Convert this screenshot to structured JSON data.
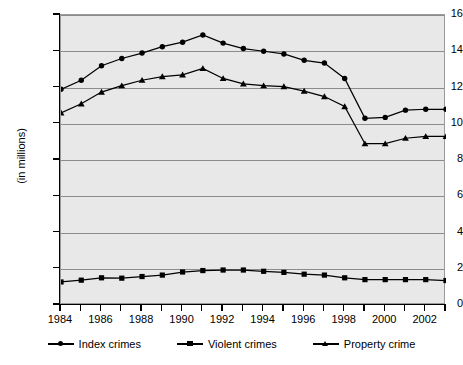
{
  "chart_data": {
    "type": "line",
    "title": "",
    "xlabel": "",
    "ylabel": "(in millions)",
    "xlim": [
      1984,
      2003
    ],
    "ylim": [
      0,
      16
    ],
    "grid": true,
    "legend_position": "bottom",
    "x": [
      1984,
      1985,
      1986,
      1987,
      1988,
      1989,
      1990,
      1991,
      1992,
      1993,
      1994,
      1995,
      1996,
      1997,
      1998,
      1999,
      2000,
      2001,
      2002,
      2003
    ],
    "x_tick_labels": [
      "1984",
      "",
      "1986",
      "",
      "1988",
      "",
      "1990",
      "",
      "1992",
      "",
      "1994",
      "",
      "1996",
      "",
      "1998",
      "",
      "2000",
      "",
      "2002",
      ""
    ],
    "y_tick_labels": [
      "0",
      "2",
      "4",
      "6",
      "8",
      "10",
      "12",
      "14",
      "16"
    ],
    "y_ticks": [
      0,
      2,
      4,
      6,
      8,
      10,
      12,
      14,
      16
    ],
    "series": [
      {
        "name": "Index crimes",
        "marker": "circle",
        "values": [
          11.9,
          12.4,
          13.2,
          13.6,
          13.9,
          14.25,
          14.5,
          14.9,
          14.45,
          14.15,
          14.0,
          13.85,
          13.5,
          13.35,
          12.5,
          10.3,
          10.35,
          10.75,
          10.8,
          10.8
        ]
      },
      {
        "name": "Violent crimes",
        "marker": "square",
        "values": [
          1.27,
          1.37,
          1.5,
          1.48,
          1.57,
          1.65,
          1.82,
          1.9,
          1.93,
          1.93,
          1.86,
          1.8,
          1.7,
          1.65,
          1.5,
          1.4,
          1.4,
          1.4,
          1.4,
          1.35
        ]
      },
      {
        "name": "Property crime",
        "marker": "triangle",
        "values": [
          10.6,
          11.1,
          11.75,
          12.1,
          12.4,
          12.6,
          12.7,
          13.05,
          12.5,
          12.2,
          12.1,
          12.05,
          11.8,
          11.5,
          10.95,
          8.9,
          8.9,
          9.2,
          9.3,
          9.3
        ]
      }
    ]
  },
  "legend": {
    "items": [
      {
        "label": "Index crimes",
        "marker": "circle"
      },
      {
        "label": "Violent crimes",
        "marker": "square"
      },
      {
        "label": "Property crime",
        "marker": "triangle"
      }
    ]
  }
}
